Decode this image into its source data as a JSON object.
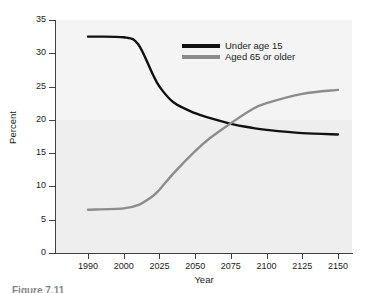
{
  "chart_data": {
    "type": "line",
    "title": "",
    "xlabel": "Year",
    "ylabel": "Percent",
    "ylim": [
      0,
      35
    ],
    "y_ticks": [
      0,
      5,
      10,
      15,
      20,
      25,
      30,
      35
    ],
    "y_tick_labels": [
      "0",
      "5",
      "10",
      "15",
      "20",
      "25",
      "30",
      "35"
    ],
    "x_tick_labels": [
      "1990",
      "2000",
      "2025",
      "2050",
      "2075",
      "2100",
      "2125",
      "2150"
    ],
    "x_tick_positions": [
      0,
      1,
      2,
      3,
      4,
      5,
      6,
      7
    ],
    "grid": false,
    "legend_position": "top-right",
    "series": [
      {
        "name": "Under age 15",
        "color": "#111111",
        "x": [
          1990,
          2000,
          2010,
          2020,
          2025,
          2035,
          2050,
          2060,
          2075,
          2090,
          2100,
          2125,
          2150
        ],
        "values": [
          32.5,
          32.4,
          31.4,
          27.0,
          25.0,
          22.6,
          21.0,
          20.3,
          19.4,
          18.8,
          18.5,
          18.0,
          17.8
        ]
      },
      {
        "name": "Aged 65 or older",
        "color": "#8c8c8c",
        "x": [
          1990,
          2000,
          2010,
          2020,
          2025,
          2035,
          2050,
          2060,
          2075,
          2090,
          2100,
          2125,
          2150
        ],
        "values": [
          6.5,
          6.7,
          7.2,
          8.5,
          9.5,
          12.0,
          15.3,
          17.2,
          19.5,
          21.6,
          22.5,
          23.9,
          24.5
        ]
      }
    ],
    "crossover": {
      "year": 2072,
      "percent": 19.4
    }
  },
  "legend": {
    "items": [
      {
        "label": "Under age 15",
        "color": "#111111"
      },
      {
        "label": "Aged 65 or older",
        "color": "#8c8c8c"
      }
    ]
  },
  "axes": {
    "x_title": "Year",
    "y_title": "Percent"
  },
  "caption": {
    "text": "Figure 7.11"
  }
}
